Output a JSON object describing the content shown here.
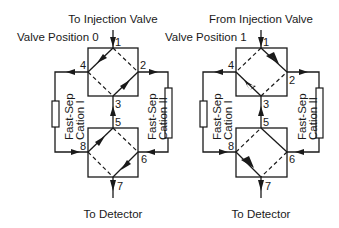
{
  "diagrams": [
    {
      "id": "position-0",
      "top_label": "To Injection Valve",
      "position_label": "Valve Position 0",
      "bottom_label": "To Detector",
      "column_left": [
        "Fast-Sep",
        "Cation I"
      ],
      "column_right": [
        "Fast-Sep",
        "Cation II"
      ],
      "ports": [
        "1",
        "2",
        "3",
        "4",
        "5",
        "6",
        "7",
        "8"
      ],
      "active_connections": [
        "1-4",
        "3-2",
        "8-5",
        "6-7"
      ],
      "inactive_connections": [
        "1-2",
        "4-3",
        "5-6",
        "8-7"
      ]
    },
    {
      "id": "position-1",
      "top_label": "From Injection Valve",
      "position_label": "Valve Position 1",
      "bottom_label": "To Detector",
      "column_left": [
        "Fast-Sep",
        "Cation I"
      ],
      "column_right": [
        "Fast-Sep",
        "Cation II"
      ],
      "ports": [
        "1",
        "2",
        "3",
        "4",
        "5",
        "6",
        "7",
        "8"
      ],
      "active_connections": [
        "1-2",
        "3-4",
        "5-6",
        "8-7"
      ],
      "inactive_connections": [
        "1-4",
        "2-3",
        "5-8",
        "6-7"
      ]
    }
  ]
}
